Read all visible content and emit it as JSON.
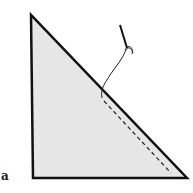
{
  "figure": {
    "label": "a",
    "triangle": {
      "fill": "#e6e6e6",
      "stroke": "#111111",
      "points": [
        [
          31,
          15
        ],
        [
          33,
          178
        ],
        [
          187,
          178
        ]
      ]
    },
    "stitch_line": {
      "style": "dashed",
      "from": [
        104,
        100
      ],
      "to": [
        171,
        172
      ]
    },
    "needle": {
      "from": [
        120,
        25
      ],
      "to": [
        130,
        52
      ]
    },
    "icons": [
      "needle-icon",
      "thread-icon"
    ]
  }
}
